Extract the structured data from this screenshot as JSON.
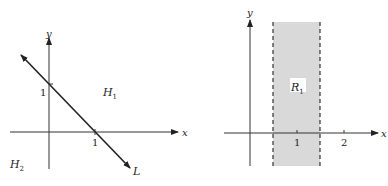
{
  "left_figure": {
    "axis_x_label": "x",
    "axis_y_label": "y",
    "tick_x": "1",
    "tick_y": "1",
    "line_label": "L",
    "region_above": "H",
    "region_above_sub": "1",
    "region_below": "H",
    "region_below_sub": "2"
  },
  "right_figure": {
    "axis_x_label": "x",
    "axis_y_label": "y",
    "tick_1": "1",
    "tick_2": "2",
    "region_label": "R",
    "region_sub": "1",
    "shade_color": "#d9d9d9"
  }
}
